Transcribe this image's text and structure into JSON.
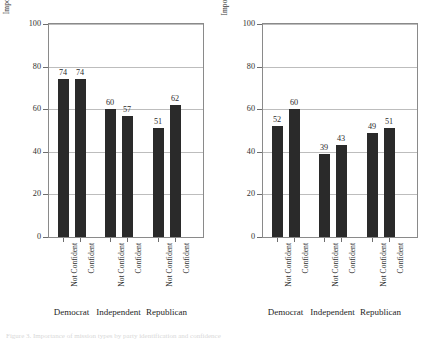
{
  "figure": {
    "caption_clipped": "Figure 3.  Importance of mission types by party identification and confidence"
  },
  "chart_data": [
    {
      "type": "bar",
      "title": "",
      "ylabel": "Importance of Humanitarian Missions Abroad",
      "xlabel": "",
      "ylim": [
        0,
        100
      ],
      "yticks": [
        0,
        20,
        40,
        60,
        80,
        100
      ],
      "grid": true,
      "legend": "none",
      "groups": [
        "Democrat",
        "Independent",
        "Republican"
      ],
      "categories": [
        "Not Confident",
        "Confident",
        "Not Confident",
        "Confident",
        "Not Confident",
        "Confident"
      ],
      "values": [
        74,
        74,
        60,
        57,
        51,
        62
      ],
      "bar_color": "#2a2a2a"
    },
    {
      "type": "bar",
      "title": "",
      "ylabel": "Importance of Civil War Intervention Missions",
      "xlabel": "",
      "ylim": [
        0,
        100
      ],
      "yticks": [
        0,
        20,
        40,
        60,
        80,
        100
      ],
      "grid": true,
      "legend": "none",
      "groups": [
        "Democrat",
        "Independent",
        "Republican"
      ],
      "categories": [
        "Not Confident",
        "Confident",
        "Not Confident",
        "Confident",
        "Not Confident",
        "Confident"
      ],
      "values": [
        52,
        60,
        39,
        43,
        49,
        51
      ],
      "bar_color": "#2a2a2a"
    }
  ],
  "panels": [
    {
      "ylabel": "Importance of Humanitarian Missions Abroad",
      "yticks": [
        "100",
        "80",
        "60",
        "40",
        "20",
        "0"
      ],
      "bars": [
        {
          "label": "74",
          "value": 74
        },
        {
          "label": "74",
          "value": 74
        },
        {
          "label": "60",
          "value": 60
        },
        {
          "label": "57",
          "value": 57
        },
        {
          "label": "51",
          "value": 51
        },
        {
          "label": "62",
          "value": 62
        }
      ],
      "xcats": [
        "Not Confident",
        "Confident",
        "Not Confident",
        "Confident",
        "Not Confident",
        "Confident"
      ],
      "groups": [
        "Democrat",
        "Independent",
        "Republican"
      ]
    },
    {
      "ylabel": "Importance of Civil War Intervention Missions",
      "yticks": [
        "100",
        "80",
        "60",
        "40",
        "20",
        "0"
      ],
      "bars": [
        {
          "label": "52",
          "value": 52
        },
        {
          "label": "60",
          "value": 60
        },
        {
          "label": "39",
          "value": 39
        },
        {
          "label": "43",
          "value": 43
        },
        {
          "label": "49",
          "value": 49
        },
        {
          "label": "51",
          "value": 51
        }
      ],
      "xcats": [
        "Not Confident",
        "Confident",
        "Not Confident",
        "Confident",
        "Not Confident",
        "Confident"
      ],
      "groups": [
        "Democrat",
        "Independent",
        "Republican"
      ]
    }
  ]
}
